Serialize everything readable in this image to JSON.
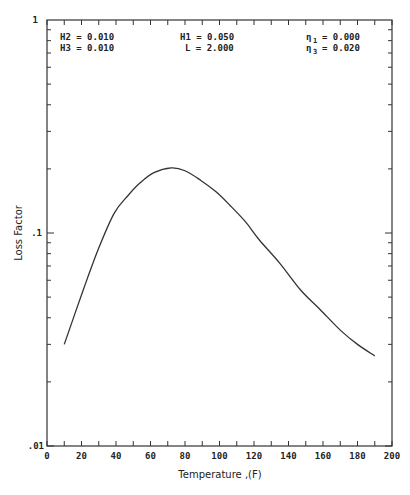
{
  "chart_data": {
    "type": "line",
    "title": "",
    "xlabel": "Temperature ,(F)",
    "ylabel": "Loss Factor",
    "xlim": [
      0,
      200
    ],
    "ylim": [
      0.01,
      1
    ],
    "yscale": "log",
    "grid": false,
    "legend": null,
    "x_ticks": [
      0,
      20,
      40,
      60,
      80,
      100,
      120,
      140,
      160,
      180,
      200
    ],
    "x_tick_labels": [
      "0",
      "20",
      "40",
      "60",
      "80",
      "100",
      "120",
      "140",
      "160",
      "180",
      "200"
    ],
    "y_ticks": [
      0.01,
      0.1,
      1
    ],
    "y_tick_labels": [
      ".01",
      ".1",
      "1"
    ],
    "series": [
      {
        "name": "Loss Factor",
        "x": [
          10,
          21,
          30,
          39,
          47,
          54,
          62,
          72,
          80,
          89,
          98,
          106,
          115,
          123,
          135,
          147,
          158,
          170,
          180,
          190
        ],
        "y": [
          0.03,
          0.054,
          0.085,
          0.124,
          0.15,
          0.172,
          0.192,
          0.202,
          0.196,
          0.177,
          0.156,
          0.135,
          0.113,
          0.093,
          0.072,
          0.054,
          0.044,
          0.035,
          0.03,
          0.0265
        ]
      }
    ],
    "annotations": [
      {
        "label": "H2",
        "value": "0.010"
      },
      {
        "label": "H3",
        "value": "0.010"
      },
      {
        "label": "H1",
        "value": "0.050"
      },
      {
        "label": "L",
        "value": "2.000"
      },
      {
        "label": "η1",
        "value": "0.000"
      },
      {
        "label": "η3",
        "value": "0.020"
      }
    ]
  },
  "params": {
    "h2": "H2 = 0.010",
    "h3": "H3 = 0.010",
    "h1": "H1 = 0.050",
    "l": "L = 2.000",
    "eta1_sym": "η",
    "eta1_sub": "1",
    "eta1_val": "= 0.000",
    "eta3_sym": "η",
    "eta3_sub": "3",
    "eta3_val": "= 0.020"
  },
  "axes": {
    "xlabel": "Temperature ,(F)",
    "ylabel": "Loss Factor",
    "y_top": "1",
    "y_mid": ".1",
    "y_bot": ".01"
  }
}
